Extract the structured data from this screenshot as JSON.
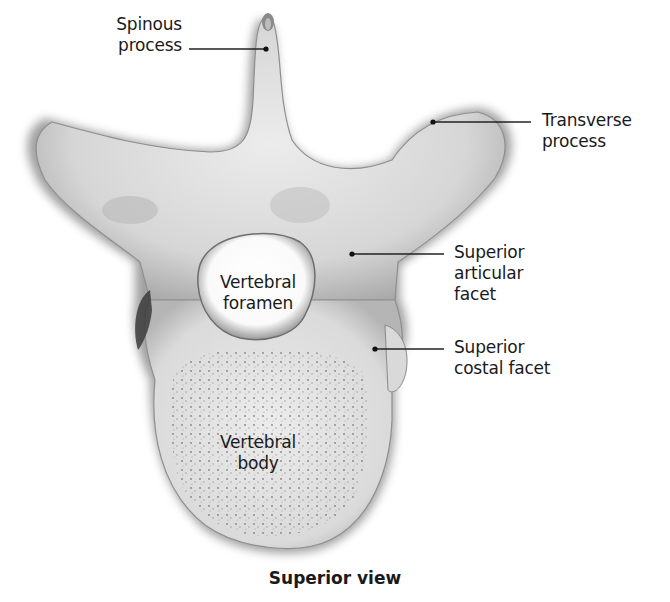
{
  "figure": {
    "view_caption": "Superior view",
    "labels": {
      "spinous_process": {
        "line1": "Spinous",
        "line2": "process"
      },
      "transverse_process": {
        "line1": "Transverse",
        "line2": "process"
      },
      "superior_articular_facet": {
        "line1": "Superior",
        "line2": "articular",
        "line3": "facet"
      },
      "superior_costal_facet": {
        "line1": "Superior",
        "line2": "costal facet"
      },
      "vertebral_foramen": {
        "line1": "Vertebral",
        "line2": "foramen"
      },
      "vertebral_body": {
        "line1": "Vertebral",
        "line2": "body"
      }
    },
    "colors": {
      "bone_light": "#e4e4e4",
      "bone_mid": "#c8c8c8",
      "bone_shadow": "#6a6a6a",
      "leader_line": "#222222",
      "text": "#1a1a1a",
      "background": "#ffffff"
    }
  }
}
